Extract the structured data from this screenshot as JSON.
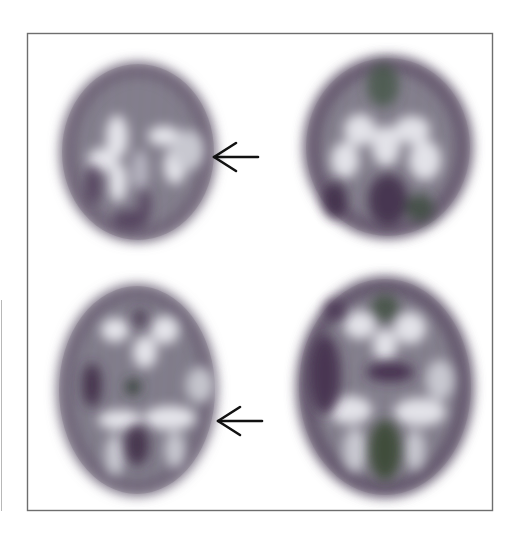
{
  "figure": {
    "type": "brain-perfusion-scan-panel",
    "layout": "2x2 grid",
    "panels": [
      {
        "id": "top-left",
        "position": "top-left",
        "has_arrow": true,
        "arrow_direction": "left",
        "arrow_points_to": "right lateral region"
      },
      {
        "id": "top-right",
        "position": "top-right",
        "has_arrow": false
      },
      {
        "id": "bottom-left",
        "position": "bottom-left",
        "has_arrow": true,
        "arrow_direction": "left",
        "arrow_points_to": "right lateral posterior region"
      },
      {
        "id": "bottom-right",
        "position": "bottom-right",
        "has_arrow": false
      }
    ],
    "colors": {
      "background": "#ffffff",
      "frame": "#6e6e6e",
      "arrow": "#111111",
      "scan_bright": "#dcdce2",
      "scan_mid": "#9c9aa4",
      "scan_dark_purple": "#4a3552",
      "scan_dark_green": "#3e4b3f"
    }
  }
}
